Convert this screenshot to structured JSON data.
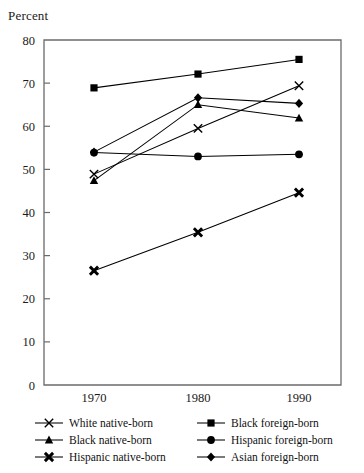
{
  "chart_data": {
    "type": "line",
    "title": "",
    "ylabel": "Percent",
    "xlabel": "",
    "categories": [
      "1970",
      "1980",
      "1990"
    ],
    "x": [
      1970,
      1980,
      1990
    ],
    "ylim": [
      0,
      80
    ],
    "yticks": [
      0,
      10,
      20,
      30,
      40,
      50,
      60,
      70,
      80
    ],
    "ytick_labels": [
      "0",
      "10",
      "20",
      "30",
      "40",
      "50",
      "60",
      "70",
      "80"
    ],
    "grid": false,
    "legend_position": "below-plot-two-columns",
    "series": [
      {
        "name": "White native-born",
        "marker": "x-thin",
        "values": [
          48.9,
          59.5,
          69.4
        ]
      },
      {
        "name": "Black native-born",
        "marker": "triangle",
        "values": [
          47.4,
          65.0,
          61.9
        ]
      },
      {
        "name": "Hispanic native-born",
        "marker": "x-bold",
        "values": [
          26.5,
          35.4,
          44.6
        ]
      },
      {
        "name": "Black foreign-born",
        "marker": "square",
        "values": [
          68.9,
          72.1,
          75.5
        ]
      },
      {
        "name": "Hispanic foreign-born",
        "marker": "circle",
        "values": [
          53.9,
          53.0,
          53.5
        ]
      },
      {
        "name": "Asian foreign-born",
        "marker": "diamond",
        "values": [
          54.0,
          66.6,
          65.3
        ]
      }
    ]
  },
  "legend": {
    "columns": [
      {
        "items": [
          {
            "label": "White native-born",
            "marker": "x-thin"
          },
          {
            "label": "Black native-born",
            "marker": "triangle"
          },
          {
            "label": "Hispanic native-born",
            "marker": "x-bold"
          }
        ]
      },
      {
        "items": [
          {
            "label": "Black foreign-born",
            "marker": "square"
          },
          {
            "label": "Hispanic foreign-born",
            "marker": "circle"
          },
          {
            "label": "Asian foreign-born",
            "marker": "diamond"
          }
        ]
      }
    ]
  },
  "colors": {
    "ink": "#000000",
    "axis": "#6b6b6b",
    "background": "#ffffff"
  }
}
